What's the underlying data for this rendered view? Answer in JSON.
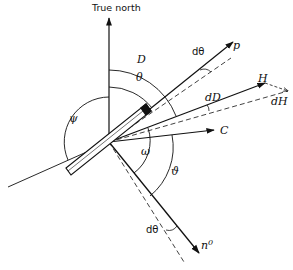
{
  "diagram": {
    "axis": {
      "label": "True north"
    },
    "vectors": [
      {
        "id": "p",
        "label": "p"
      },
      {
        "id": "H",
        "label": "H"
      },
      {
        "id": "dH",
        "label": "dH"
      },
      {
        "id": "C",
        "label": "C"
      },
      {
        "id": "n0",
        "label": "n",
        "superscript": "0"
      }
    ],
    "angles": [
      {
        "id": "D",
        "label": "D"
      },
      {
        "id": "theta",
        "label": "θ"
      },
      {
        "id": "psi",
        "label": "ψ"
      },
      {
        "id": "omega",
        "label": "ω"
      },
      {
        "id": "vartheta",
        "label": "ϑ"
      },
      {
        "id": "dtheta_top",
        "label": "dθ"
      },
      {
        "id": "dD",
        "label": "dD"
      },
      {
        "id": "dtheta_bottom",
        "label": "dθ"
      }
    ],
    "colors": {
      "ink": "#111111",
      "background": "#ffffff"
    }
  }
}
